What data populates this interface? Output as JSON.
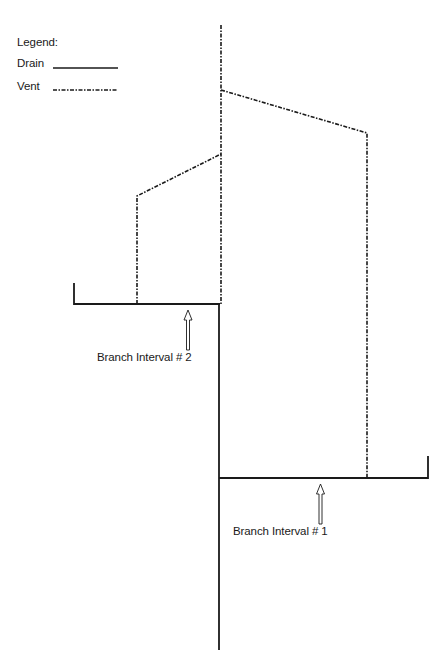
{
  "legend": {
    "title": "Legend:",
    "items": [
      {
        "label": "Drain",
        "style": "solid"
      },
      {
        "label": "Vent",
        "style": "dash-dot"
      }
    ]
  },
  "labels": {
    "branch_interval_2": "Branch Interval # 2",
    "branch_interval_1": "Branch Interval # 1"
  },
  "colors": {
    "line": "#1a1a1a",
    "background": "#ffffff"
  }
}
